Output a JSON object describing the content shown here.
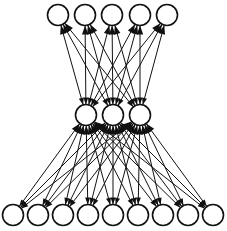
{
  "figure": {
    "background_color": "#ffffff",
    "node_stroke_color": "#111111",
    "node_fill_color": "#ffffff",
    "edge_color": "#111111",
    "width": 227,
    "height": 231
  },
  "chart_data": {
    "type": "diagram",
    "subtype": "neural-network-graph",
    "title": "",
    "xlabel": "",
    "ylabel": "",
    "grid": false,
    "legend": false,
    "directed": true,
    "arrowheads": "both-ends",
    "layers": [
      {
        "name": "output-layer",
        "position": "top",
        "count": 5,
        "radius": 10.5,
        "cy": 15,
        "cx": [
          58,
          85,
          112,
          140,
          167
        ]
      },
      {
        "name": "hidden-layer",
        "position": "middle",
        "count": 3,
        "radius": 10.5,
        "cy": 115,
        "cx": [
          86,
          113,
          140
        ]
      },
      {
        "name": "input-layer",
        "position": "bottom",
        "count": 9,
        "radius": 10.5,
        "cy": 215,
        "cx": [
          13,
          38,
          63,
          88,
          113,
          138,
          163,
          188,
          213
        ]
      }
    ],
    "connections": [
      {
        "name": "hidden-to-output",
        "from_layer": "hidden-layer",
        "to_layer": "output-layer",
        "fully_connected": true,
        "edge_count": 15
      },
      {
        "name": "input-to-hidden",
        "from_layer": "input-layer",
        "to_layer": "hidden-layer",
        "fully_connected": true,
        "edge_count": 27
      }
    ]
  }
}
